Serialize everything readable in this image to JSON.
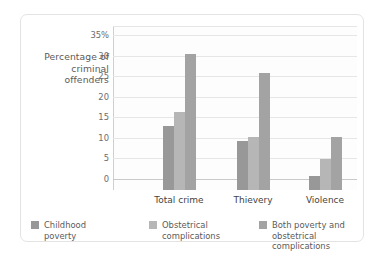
{
  "chart_data": {
    "type": "bar",
    "title": "",
    "xlabel": "",
    "ylabel": "Percentage\nof criminal\noffenders",
    "categories": [
      "Total crime",
      "Thievery",
      "Violence"
    ],
    "series": [
      {
        "name": "Childhood\npoverty",
        "color": "#989898",
        "values": [
          15.5,
          12.0,
          3.5
        ]
      },
      {
        "name": "Obstetrical\ncomplications",
        "color": "#b6b6b6",
        "values": [
          19.0,
          13.0,
          7.5
        ]
      },
      {
        "name": "Both poverty and\nobstetrical complications",
        "color": "#a3a3a3",
        "values": [
          33.0,
          28.5,
          13.0
        ]
      }
    ],
    "ylim": [
      0,
      36.5
    ],
    "yticks": [
      {
        "value": 35,
        "label": "35%"
      },
      {
        "value": 30,
        "label": "30"
      },
      {
        "value": 25,
        "label": "25"
      },
      {
        "value": 20,
        "label": "20"
      },
      {
        "value": 15,
        "label": "15"
      },
      {
        "value": 10,
        "label": "10"
      },
      {
        "value": 5,
        "label": "5"
      },
      {
        "value": 0,
        "label": "0"
      }
    ],
    "grid": true,
    "legend_position": "bottom"
  },
  "card": {
    "border_color": "#e3e3e3",
    "background": "#ffffff"
  }
}
